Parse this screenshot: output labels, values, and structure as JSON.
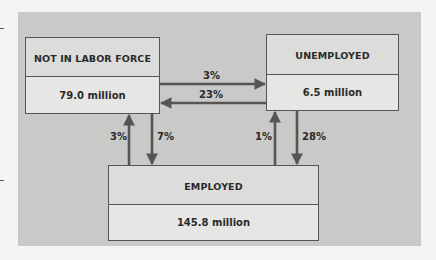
{
  "diagram": {
    "nodes": {
      "not_in_labor_force": {
        "label": "NOT IN LABOR FORCE",
        "value": "79.0 million"
      },
      "unemployed": {
        "label": "UNEMPLOYED",
        "value": "6.5 million"
      },
      "employed": {
        "label": "EMPLOYED",
        "value": "145.8 million"
      }
    },
    "flows": {
      "nlf_to_unemployed": "3%",
      "unemployed_to_nlf": "23%",
      "employed_to_nlf": "3%",
      "nlf_to_employed": "7%",
      "employed_to_unemployed": "1%",
      "unemployed_to_employed": "28%"
    },
    "colors": {
      "panel": "#c9c9c7",
      "box": "#dcdcda",
      "border": "#555555",
      "arrow": "#555555",
      "text": "#2a2a2a"
    }
  }
}
